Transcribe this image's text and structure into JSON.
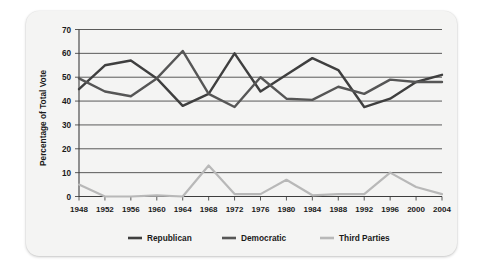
{
  "chart_data": {
    "type": "line",
    "title": "",
    "xlabel": "",
    "ylabel": "Percentage of Total Vote",
    "x": [
      1948,
      1952,
      1956,
      1960,
      1964,
      1968,
      1972,
      1976,
      1980,
      1984,
      1988,
      1992,
      1996,
      2000,
      2004
    ],
    "xtick_labels": [
      "1948",
      "1952",
      "1956",
      "1960",
      "1964",
      "1968",
      "1972",
      "1976",
      "1980",
      "1984",
      "1988",
      "1992",
      "1996",
      "2000",
      "2004"
    ],
    "ytick_labels": [
      "0",
      "10",
      "20",
      "30",
      "40",
      "50",
      "60",
      "70"
    ],
    "yticks": [
      0,
      10,
      20,
      30,
      40,
      50,
      60,
      70
    ],
    "ylim": [
      0,
      70
    ],
    "xlim": [
      1948,
      2004
    ],
    "grid": "horizontal",
    "legend_position": "bottom",
    "series": [
      {
        "name": "Republican",
        "color": "#3f3f3f",
        "values": [
          45,
          55,
          57,
          49.5,
          38,
          43,
          60,
          44,
          51,
          58,
          53,
          37.5,
          41,
          48,
          51
        ]
      },
      {
        "name": "Democratic",
        "color": "#565656",
        "values": [
          49.5,
          44,
          42,
          49.5,
          61,
          43,
          37.5,
          50,
          41,
          40.5,
          46,
          43,
          49,
          48,
          48
        ]
      },
      {
        "name": "Third Parties",
        "color": "#b8b8b8",
        "values": [
          5,
          0,
          0,
          0.5,
          0,
          13,
          1,
          1,
          7,
          0.5,
          1,
          1,
          10,
          4,
          1
        ]
      }
    ]
  },
  "legend": {
    "items": [
      {
        "label": "Republican",
        "color": "#3f3f3f"
      },
      {
        "label": "Democratic",
        "color": "#565656"
      },
      {
        "label": "Third Parties",
        "color": "#b8b8b8"
      }
    ]
  },
  "colors": {
    "card_background": "#f4f4f3",
    "page_background": "#ffffff",
    "axis": "#3d3d3d",
    "text": "#1a1a1a"
  }
}
